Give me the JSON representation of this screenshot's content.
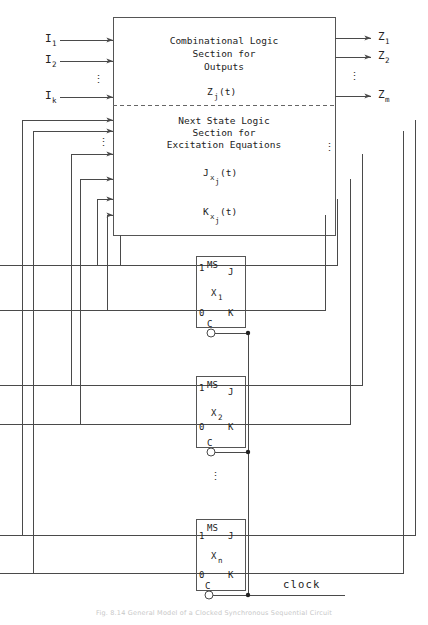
{
  "figure": {
    "caption": "Fig. 8.14  General Model of a Clocked Synchronous Sequential Circuit"
  },
  "main_block": {
    "upper": {
      "line1": "Combinational Logic",
      "line2": "Section for",
      "line3": "Outputs",
      "expr_base": "Z",
      "expr_sub": "j",
      "expr_tail": "(t)"
    },
    "lower": {
      "line1": "Next State Logic",
      "line2": "Section for",
      "line3": "Excitation Equations",
      "expr_j_base": "J",
      "expr_j_sub": "x",
      "expr_j_sub2": "j",
      "expr_j_tail": "(t)",
      "expr_k_base": "K",
      "expr_k_sub": "x",
      "expr_k_sub2": "j",
      "expr_k_tail": "(t)"
    }
  },
  "inputs": [
    {
      "base": "I",
      "sub": "1"
    },
    {
      "base": "I",
      "sub": "2"
    },
    {
      "base": "I",
      "sub": "k"
    }
  ],
  "input_ellipsis": "⋮",
  "outputs": [
    {
      "base": "Z",
      "sub": "1"
    },
    {
      "base": "Z",
      "sub": "2"
    },
    {
      "base": "Z",
      "sub": "m"
    }
  ],
  "output_ellipsis": "⋮",
  "flipflops": [
    {
      "type": "MS",
      "j_label": "J",
      "k_label": "K",
      "one_label": "1",
      "zero_label": "0",
      "c_label": "C",
      "state_base": "X",
      "state_sub": "1"
    },
    {
      "type": "MS",
      "j_label": "J",
      "k_label": "K",
      "one_label": "1",
      "zero_label": "0",
      "c_label": "C",
      "state_base": "X",
      "state_sub": "2"
    },
    {
      "type": "MS",
      "j_label": "J",
      "k_label": "K",
      "one_label": "1",
      "zero_label": "0",
      "c_label": "C",
      "state_base": "X",
      "state_sub": "n"
    }
  ],
  "flipflop_ellipsis": "⋮",
  "feedback_ellipsis_left": "⋮",
  "feedback_ellipsis_right": "⋮",
  "clock": {
    "label": "clock"
  },
  "colors": {
    "wire": "#4a4a4a",
    "box": "#555555",
    "text": "#222222",
    "divider": "#666666",
    "caption": "#c8c8c8"
  }
}
